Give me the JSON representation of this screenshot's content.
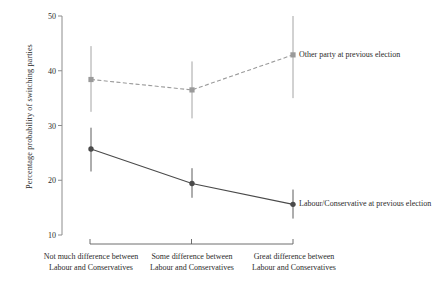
{
  "chart_data": {
    "type": "line",
    "title": "",
    "subtitle": "",
    "xlabel": "",
    "ylabel": "Percentage probability of switching parties",
    "ylim": [
      10,
      50
    ],
    "yticks": [
      10,
      20,
      30,
      40,
      50
    ],
    "ytick_labels": [
      "10",
      "20",
      "30",
      "40",
      "50"
    ],
    "grid": false,
    "legend_position": "inline-annotation",
    "categories": [
      "Not much difference between Labour and Conservatives",
      "Some difference between Labour and Conservatives",
      "Great difference between Labour and Conservatives"
    ],
    "category_lines": [
      [
        "Not much difference between",
        "Labour and Conservatives"
      ],
      [
        "Some difference between",
        "Labour and Conservatives"
      ],
      [
        "Great difference between",
        "Labour and Conservatives"
      ]
    ],
    "series": [
      {
        "name": "Other party at previous election",
        "style": "dashed",
        "color": "#9a9a9a",
        "marker": "square",
        "values": [
          38.4,
          36.5,
          42.9
        ],
        "ci_low": [
          32.5,
          31.3,
          35.0
        ],
        "ci_high": [
          44.5,
          41.7,
          50.0
        ]
      },
      {
        "name": "Labour/Conservative at previous election",
        "style": "solid",
        "color": "#4a4a4a",
        "marker": "circle",
        "values": [
          25.7,
          19.4,
          15.6
        ],
        "ci_low": [
          21.6,
          16.8,
          13.0
        ],
        "ci_high": [
          29.6,
          22.2,
          18.3
        ]
      }
    ],
    "annotations": [
      {
        "text": "Other party at previous election",
        "anchor_series": 0,
        "anchor_category": 2
      },
      {
        "text": "Labour/Conservative at previous election",
        "anchor_series": 1,
        "anchor_category": 2
      }
    ]
  },
  "axis": {
    "y_title": "Percentage probability of switching parties",
    "y_tick_50": "50",
    "y_tick_40": "40",
    "y_tick_30": "30",
    "y_tick_20": "20",
    "y_tick_10": "10"
  },
  "x_labels": {
    "cat1_line1": "Not much difference between",
    "cat1_line2": "Labour and Conservatives",
    "cat2_line1": "Some difference between",
    "cat2_line2": "Labour and Conservatives",
    "cat3_line1": "Great difference between",
    "cat3_line2": "Labour and Conservatives"
  },
  "annotations": {
    "other_party": "Other party at previous election",
    "lab_con": "Labour/Conservative at previous election"
  },
  "colors": {
    "series_other": "#9a9a9a",
    "series_labcon": "#4a4a4a",
    "axis": "#8c8c8c",
    "text": "#2b2b2b",
    "background": "#ffffff"
  }
}
